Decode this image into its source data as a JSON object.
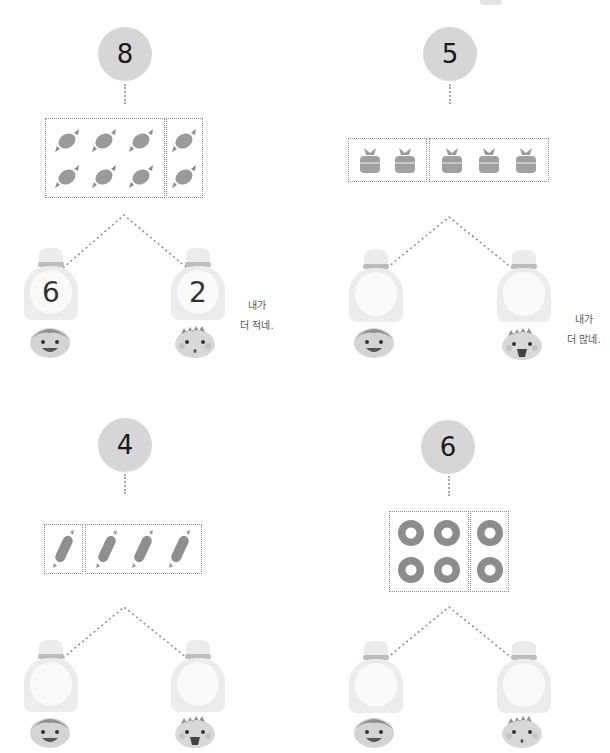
{
  "problems": [
    {
      "total": "8",
      "item_icon": "wrapped-candy-icon",
      "groups": [
        6,
        2
      ],
      "left_answer": "6",
      "right_answer": "2",
      "speech_line1": "내가",
      "speech_line2": "더 적네."
    },
    {
      "total": "5",
      "item_icon": "candy-bag-icon",
      "groups": [
        2,
        3
      ],
      "left_answer": "",
      "right_answer": "",
      "speech_line1": "내가",
      "speech_line2": "더 많네."
    },
    {
      "total": "4",
      "item_icon": "stick-candy-icon",
      "groups": [
        1,
        3
      ],
      "left_answer": "",
      "right_answer": ""
    },
    {
      "total": "6",
      "item_icon": "donut-icon",
      "groups": [
        4,
        2
      ],
      "left_answer": "",
      "right_answer": ""
    }
  ],
  "colors": {
    "circle": "#d6d6d6",
    "dotted": "#8f8f8f",
    "item": "#9a9a9a",
    "bag": "#ececec"
  }
}
